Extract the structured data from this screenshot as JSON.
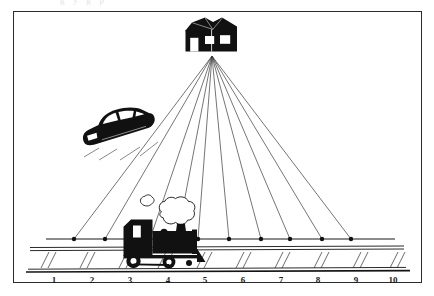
{
  "page": {
    "background_color": "#ffffff",
    "scan_artifact_text": "g y g p",
    "frame": {
      "border_color": "#2b2b2b",
      "fill_color": "#ffffff",
      "x": 13,
      "y": 11,
      "width": 409,
      "height": 272
    }
  },
  "diagram": {
    "type": "linear-perspective-illustration",
    "ink_color": "#111111",
    "line_color": "#333333",
    "vanishing_point": {
      "label": "vanishing-point",
      "x": 212,
      "y": 56
    },
    "objects": [
      {
        "name": "house",
        "label": "house",
        "x": 185,
        "y": 18,
        "width": 52,
        "height": 34
      },
      {
        "name": "car",
        "label": "car",
        "x": 80,
        "y": 110,
        "width": 74,
        "height": 40
      },
      {
        "name": "locomotive",
        "label": "steam-locomotive",
        "x": 123,
        "y": 218,
        "width": 78,
        "height": 50
      },
      {
        "name": "smoke-large",
        "label": "smoke-puff-large",
        "x": 157,
        "y": 198,
        "width": 40,
        "height": 30
      },
      {
        "name": "smoke-small",
        "label": "smoke-puff-small",
        "x": 139,
        "y": 195,
        "width": 16,
        "height": 16
      }
    ],
    "horizon_line": {
      "label": "horizon-line",
      "y": 239,
      "x_start": 46,
      "x_end": 395
    },
    "ray_points": [
      {
        "id": "p1",
        "x": 74,
        "y": 239
      },
      {
        "id": "p2",
        "x": 105,
        "y": 239
      },
      {
        "id": "p3",
        "x": 150,
        "y": 239
      },
      {
        "id": "p4",
        "x": 177,
        "y": 239
      },
      {
        "id": "p5",
        "x": 198,
        "y": 239
      },
      {
        "id": "p6",
        "x": 229,
        "y": 239
      },
      {
        "id": "p7",
        "x": 261,
        "y": 239
      },
      {
        "id": "p8",
        "x": 290,
        "y": 239
      },
      {
        "id": "p9",
        "x": 322,
        "y": 239
      },
      {
        "id": "p10",
        "x": 351,
        "y": 239
      }
    ],
    "railroad": {
      "label": "railroad-track",
      "rail_top_y": 249,
      "rail_mid_y": 253,
      "rail_bottom_y": 270,
      "tie_count": 10
    }
  },
  "ruler": {
    "label": "number-scale",
    "baseline_y": 272,
    "labels_y": 275,
    "ticks": [
      {
        "value": "1",
        "x": 54
      },
      {
        "value": "2",
        "x": 92
      },
      {
        "value": "3",
        "x": 130
      },
      {
        "value": "4",
        "x": 168
      },
      {
        "value": "5",
        "x": 205
      },
      {
        "value": "6",
        "x": 243
      },
      {
        "value": "7",
        "x": 281
      },
      {
        "value": "8",
        "x": 318
      },
      {
        "value": "9",
        "x": 356
      },
      {
        "value": "10",
        "x": 393
      }
    ]
  }
}
